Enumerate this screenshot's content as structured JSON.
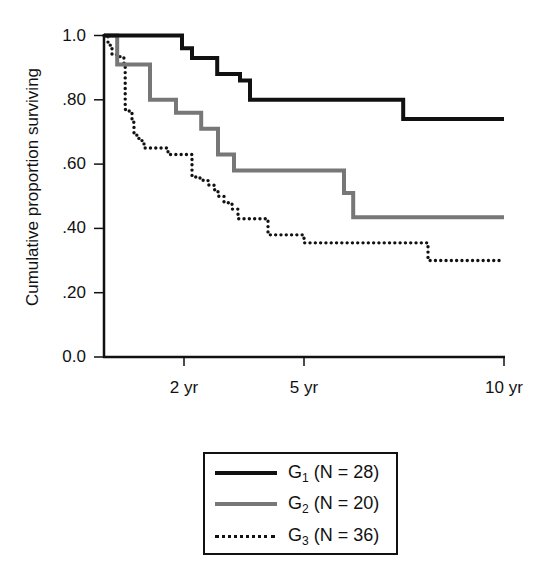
{
  "chart_data": {
    "type": "line",
    "subtype": "kaplan-meier step curve",
    "title": "",
    "xlabel": "",
    "ylabel": "Cumulative proportion surviving",
    "xlim": [
      0,
      10
    ],
    "ylim": [
      0,
      1
    ],
    "x_ticks": [
      {
        "value": 2,
        "label": "2 yr"
      },
      {
        "value": 5,
        "label": "5 yr"
      },
      {
        "value": 10,
        "label": "10 yr"
      }
    ],
    "y_ticks": [
      {
        "value": 1.0,
        "label": "1.0"
      },
      {
        "value": 0.8,
        "label": ".80"
      },
      {
        "value": 0.6,
        "label": ".60"
      },
      {
        "value": 0.4,
        "label": ".40"
      },
      {
        "value": 0.2,
        "label": ".20"
      },
      {
        "value": 0.0,
        "label": "0.0"
      }
    ],
    "grid": false,
    "legend_position": "below",
    "series": [
      {
        "name": "G1 (N = 28)",
        "group": "G",
        "subscript": "1",
        "n_label": "(N = 28)",
        "style": "solid",
        "color": "#111111",
        "width": 4,
        "steps": [
          [
            0,
            1.0
          ],
          [
            1.95,
            0.96
          ],
          [
            2.2,
            0.93
          ],
          [
            2.83,
            0.88
          ],
          [
            3.4,
            0.86
          ],
          [
            3.65,
            0.8
          ],
          [
            7.48,
            0.74
          ]
        ],
        "end": 10
      },
      {
        "name": "G2 (N = 20)",
        "group": "G",
        "subscript": "2",
        "n_label": "(N = 20)",
        "style": "solid",
        "color": "#777777",
        "width": 4,
        "steps": [
          [
            0,
            1.0
          ],
          [
            0.33,
            0.91
          ],
          [
            1.15,
            0.8
          ],
          [
            1.8,
            0.76
          ],
          [
            2.43,
            0.71
          ],
          [
            2.85,
            0.63
          ],
          [
            3.25,
            0.58
          ],
          [
            6.0,
            0.51
          ],
          [
            6.23,
            0.435
          ]
        ],
        "end": 10
      },
      {
        "name": "G3 (N = 36)",
        "group": "G",
        "subscript": "3",
        "n_label": "(N = 36)",
        "style": "dotted",
        "color": "#111111",
        "width": 3,
        "steps": [
          [
            0,
            1.0
          ],
          [
            0.1,
            0.97
          ],
          [
            0.2,
            0.94
          ],
          [
            0.4,
            0.93
          ],
          [
            0.5,
            0.91
          ],
          [
            0.53,
            0.77
          ],
          [
            0.63,
            0.76
          ],
          [
            0.7,
            0.73
          ],
          [
            0.75,
            0.69
          ],
          [
            0.85,
            0.68
          ],
          [
            0.95,
            0.67
          ],
          [
            1.0,
            0.65
          ],
          [
            1.6,
            0.63
          ],
          [
            2.2,
            0.56
          ],
          [
            2.4,
            0.55
          ],
          [
            2.6,
            0.535
          ],
          [
            2.75,
            0.52
          ],
          [
            2.85,
            0.5
          ],
          [
            3.0,
            0.48
          ],
          [
            3.2,
            0.46
          ],
          [
            3.35,
            0.43
          ],
          [
            4.1,
            0.38
          ],
          [
            5.0,
            0.355
          ],
          [
            8.1,
            0.3
          ]
        ],
        "end": 9.9
      }
    ]
  },
  "axes": {
    "ylabel": "Cumulative proportion surviving"
  }
}
